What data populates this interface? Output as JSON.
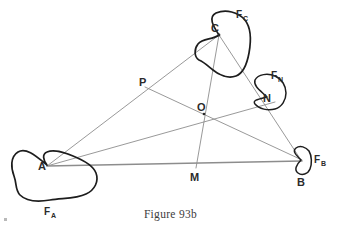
{
  "figure": {
    "caption": "Figure 93b",
    "title": "Figure 93b",
    "type": "geometric-diagram",
    "colors": {
      "background": "#ffffff",
      "construction_line": "#8d8d8d",
      "blob_outline": "#1d1d1d",
      "label_text": "#2b2b2b",
      "caption_text": "#3c3c3c"
    },
    "points": [
      {
        "id": "A",
        "label": "A",
        "x": 47,
        "y": 166,
        "label_x": 38,
        "label_y": 170,
        "kind": "triangle-vertex"
      },
      {
        "id": "B",
        "label": "B",
        "x": 301,
        "y": 160,
        "label_x": 298,
        "label_y": 185,
        "kind": "triangle-vertex"
      },
      {
        "id": "C",
        "label": "C",
        "x": 219,
        "y": 35,
        "label_x": 213,
        "label_y": 32,
        "kind": "triangle-vertex"
      },
      {
        "id": "O",
        "label": "O",
        "x": 204,
        "y": 114,
        "label_x": 198,
        "label_y": 111,
        "kind": "concurrency-point"
      },
      {
        "id": "P",
        "label": "P",
        "x": 146,
        "y": 88,
        "label_x": 139,
        "label_y": 85,
        "kind": "cevian-foot"
      },
      {
        "id": "M",
        "label": "M",
        "x": 197,
        "y": 166,
        "label_x": 192,
        "label_y": 180,
        "kind": "cevian-foot"
      },
      {
        "id": "N",
        "label": "N",
        "x": 267,
        "y": 97,
        "label_x": 262,
        "label_y": 101,
        "kind": "cevian-foot"
      }
    ],
    "region_labels": [
      {
        "id": "F_A",
        "base": "F",
        "sub": "A",
        "x": 48,
        "y": 214,
        "for_point": "A"
      },
      {
        "id": "F_B",
        "base": "F",
        "sub": "B",
        "x": 314,
        "y": 162,
        "for_point": "B"
      },
      {
        "id": "F_C",
        "base": "F",
        "sub": "C",
        "x": 238,
        "y": 17,
        "for_point": "C"
      },
      {
        "id": "F_N",
        "base": "F",
        "sub": "N",
        "x": 273,
        "y": 78,
        "for_point": "N"
      }
    ],
    "segments": [
      {
        "id": "AB",
        "from": "A",
        "to": "B",
        "style": "base"
      },
      {
        "id": "AC",
        "from": "A",
        "to": "C",
        "style": "construction"
      },
      {
        "id": "BC",
        "from": "B",
        "to": "C",
        "style": "construction"
      },
      {
        "id": "AN",
        "from": "A",
        "to": "N",
        "style": "construction",
        "note": "cevian A through O to N on BC"
      },
      {
        "id": "CM",
        "from": "C",
        "to": "M",
        "style": "construction",
        "note": "cevian C through O to M on AB"
      },
      {
        "id": "PB",
        "from": "P",
        "to": "B",
        "style": "construction",
        "note": "cevian B through O to P on AC"
      }
    ],
    "regions": [
      {
        "id": "F_A",
        "at": "A",
        "shape": "irregular-blob",
        "size": "large"
      },
      {
        "id": "F_B",
        "at": "B",
        "shape": "irregular-blob",
        "size": "small"
      },
      {
        "id": "F_C",
        "at": "C",
        "shape": "irregular-blob",
        "size": "medium"
      },
      {
        "id": "F_N",
        "at": "N",
        "shape": "irregular-blob",
        "size": "small"
      }
    ]
  }
}
